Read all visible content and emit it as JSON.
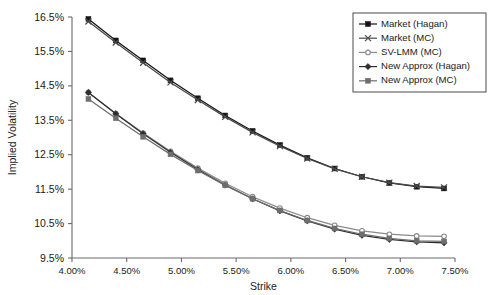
{
  "chart_data": {
    "type": "line",
    "title": "",
    "xlabel": "Strike",
    "ylabel": "Implied Volatility",
    "xlim": [
      4.0,
      7.5
    ],
    "ylim": [
      9.5,
      16.5
    ],
    "xticks": [
      "4.00%",
      "4.50%",
      "5.00%",
      "5.50%",
      "6.00%",
      "6.50%",
      "7.00%",
      "7.50%"
    ],
    "xtick_values": [
      4.0,
      4.5,
      5.0,
      5.5,
      6.0,
      6.5,
      7.0,
      7.5
    ],
    "yticks": [
      "9.5%",
      "10.5%",
      "11.5%",
      "12.5%",
      "13.5%",
      "14.5%",
      "15.5%",
      "16.5%"
    ],
    "ytick_values": [
      9.5,
      10.5,
      11.5,
      12.5,
      13.5,
      14.5,
      15.5,
      16.5
    ],
    "grid": false,
    "legend_position": "top-right",
    "x": [
      4.15,
      4.4,
      4.65,
      4.9,
      5.15,
      5.4,
      5.65,
      5.9,
      6.15,
      6.4,
      6.65,
      6.9,
      7.15,
      7.4
    ],
    "series": [
      {
        "name": "Market (Hagan)",
        "marker": "filled-square",
        "color": "#141414",
        "values": [
          16.44,
          15.82,
          15.24,
          14.66,
          14.14,
          13.64,
          13.19,
          12.78,
          12.41,
          12.1,
          11.86,
          11.68,
          11.57,
          11.52
        ]
      },
      {
        "name": "Market (MC)",
        "marker": "cross-x",
        "color": "#4a4a4a",
        "values": [
          16.37,
          15.76,
          15.17,
          14.6,
          14.09,
          13.6,
          13.15,
          12.75,
          12.39,
          12.09,
          11.86,
          11.69,
          11.59,
          11.55
        ]
      },
      {
        "name": "SV-LMM (MC)",
        "marker": "open-circle",
        "color": "#8a8a8a",
        "values": [
          14.31,
          13.7,
          13.13,
          12.6,
          12.11,
          11.67,
          11.28,
          10.95,
          10.67,
          10.45,
          10.29,
          10.19,
          10.14,
          10.13
        ]
      },
      {
        "name": "New Approx (Hagan)",
        "marker": "diamond",
        "color": "#2e2e2e",
        "values": [
          14.31,
          13.69,
          13.11,
          12.57,
          12.07,
          11.62,
          11.22,
          10.87,
          10.58,
          10.34,
          10.16,
          10.04,
          9.97,
          9.94
        ]
      },
      {
        "name": "New Approx (MC)",
        "marker": "filled-square",
        "color": "#6e6e6e",
        "values": [
          14.12,
          13.56,
          13.02,
          12.51,
          12.04,
          11.61,
          11.22,
          10.88,
          10.59,
          10.36,
          10.19,
          10.07,
          10.0,
          9.98
        ]
      }
    ]
  }
}
